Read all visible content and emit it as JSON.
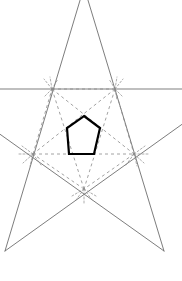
{
  "figure": {
    "canvas": {
      "width": 182,
      "height": 281
    },
    "background_color": "#ffffff",
    "colors": {
      "star_stroke": "#6e6e6e",
      "construction_dashed_stroke": "#8a8a8a",
      "baseline_stroke": "#808080",
      "inner_pentagon_stroke": "#000000",
      "inner_pentagon_fill": "none"
    },
    "stroke_widths": {
      "star": 0.9,
      "construction_dashed": 0.8,
      "baseline": 1.1,
      "inner_pentagon": 2.2
    },
    "dash_patterns": {
      "construction": "3,3",
      "tick": "2,2"
    },
    "star_points": [
      {
        "name": "apex-top",
        "x": 84,
        "y": -13
      },
      {
        "name": "point-right",
        "x": 188,
        "y": 120
      },
      {
        "name": "point-bottom-right",
        "x": 164,
        "y": 251
      },
      {
        "name": "point-bottom-left",
        "x": 5,
        "y": 251
      },
      {
        "name": "point-left",
        "x": -20,
        "y": 120
      }
    ],
    "construction_vertices": [
      {
        "name": "vertex-top-left",
        "x": 52,
        "y": 89
      },
      {
        "name": "vertex-top-right",
        "x": 115,
        "y": 89
      },
      {
        "name": "vertex-right",
        "x": 134,
        "y": 154
      },
      {
        "name": "vertex-bottom",
        "x": 84,
        "y": 189
      },
      {
        "name": "vertex-left",
        "x": 33,
        "y": 154
      }
    ],
    "inner_pentagon_vertices": [
      {
        "name": "inner-apex",
        "x": 84,
        "y": 116
      },
      {
        "name": "inner-right-upper",
        "x": 100,
        "y": 128
      },
      {
        "name": "inner-right-lower",
        "x": 94,
        "y": 154
      },
      {
        "name": "inner-left-lower",
        "x": 69,
        "y": 154
      },
      {
        "name": "inner-left-upper",
        "x": 67,
        "y": 128
      }
    ],
    "baseline": {
      "name": "horizontal-baseline",
      "y": 89,
      "x_start": 0,
      "x_end": 182
    },
    "mid_horizontal": {
      "name": "horizontal-mid-dashed",
      "y": 154,
      "x_start": 19,
      "x_end": 150
    },
    "labels": []
  }
}
